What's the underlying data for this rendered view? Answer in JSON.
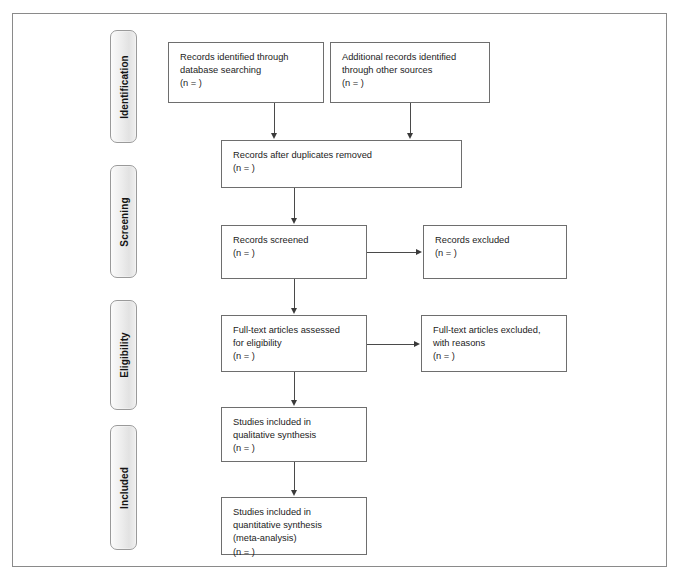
{
  "diagram": {
    "type": "prisma-flow-diagram",
    "background_color": "#ffffff",
    "frame_border_color": "#8a8a8a",
    "box_border_color": "#6e6e6e",
    "connector_color": "#4a4a4a",
    "tab_fill_color": "#ececec",
    "text_color": "#1c1c1c"
  },
  "stages": [
    {
      "id": "identification",
      "label": "Identification"
    },
    {
      "id": "screening",
      "label": "Screening"
    },
    {
      "id": "eligibility",
      "label": "Eligibility"
    },
    {
      "id": "included",
      "label": "Included"
    }
  ],
  "boxes": [
    {
      "id": "records-identified",
      "text": "Records identified through\ndatabase searching\n(n =  )"
    },
    {
      "id": "additional-records",
      "text": "Additional records identified\nthrough other sources\n(n =  )"
    },
    {
      "id": "records-after-duplicates",
      "text": "Records after duplicates removed\n(n =  )"
    },
    {
      "id": "records-screened",
      "text": "Records screened\n(n =  )"
    },
    {
      "id": "records-excluded",
      "text": "Records excluded\n(n =  )"
    },
    {
      "id": "fulltext-assessed",
      "text": "Full-text articles assessed\nfor eligibility\n(n =  )"
    },
    {
      "id": "fulltext-excluded",
      "text": "Full-text articles excluded,\nwith reasons\n(n =  )"
    },
    {
      "id": "studies-qualitative",
      "text": "Studies included in\nqualitative synthesis\n(n =  )"
    },
    {
      "id": "studies-quantitative",
      "text": "Studies included in\nquantitative synthesis\n(meta-analysis)\n(n =  )"
    }
  ]
}
